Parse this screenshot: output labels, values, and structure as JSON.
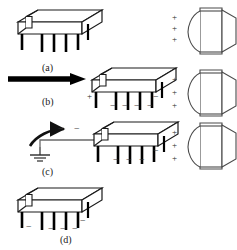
{
  "figure": {
    "background_color": "#ffffff",
    "ink_color": "#1a1a1a",
    "width": 237,
    "height": 250
  },
  "captions": [
    {
      "id": "a",
      "label": "(a)",
      "x": 42,
      "y": 62
    },
    {
      "id": "b",
      "label": "(b)",
      "x": 42,
      "y": 96
    },
    {
      "id": "c",
      "label": "(c)",
      "x": 42,
      "y": 166
    },
    {
      "id": "d",
      "label": "(d)",
      "x": 60,
      "y": 234
    }
  ],
  "steps": [
    {
      "id": "a",
      "label": "(a)",
      "description": "Uncharged IC package",
      "device_charges": [],
      "person_charges": [
        "+",
        "+",
        "+"
      ]
    },
    {
      "id": "b",
      "label": "(b)",
      "description": "Device approaches charged person; induction charges package",
      "device_charges": [
        "+",
        "-",
        "-",
        "-",
        "-",
        "-"
      ],
      "person_charges": [
        "+",
        "+",
        "+"
      ]
    },
    {
      "id": "c",
      "label": "(c)",
      "description": "Device grounded; electrons discharge to ground",
      "device_charges": [
        "-",
        "-",
        "-"
      ],
      "flow_charges": [
        "-",
        "-"
      ],
      "person_charges": [
        "+",
        "+",
        "+"
      ]
    },
    {
      "id": "d",
      "label": "(d)",
      "description": "Device left with residual negative charge",
      "device_charges": [
        "-",
        "-",
        "-",
        "-",
        "-"
      ],
      "person_charges": []
    }
  ],
  "charge_marks": [
    {
      "sign": "+",
      "x": 172,
      "y": 13
    },
    {
      "sign": "+",
      "x": 172,
      "y": 24
    },
    {
      "sign": "+",
      "x": 172,
      "y": 35
    },
    {
      "sign": "+",
      "x": 172,
      "y": 75
    },
    {
      "sign": "+",
      "x": 172,
      "y": 88
    },
    {
      "sign": "+",
      "x": 172,
      "y": 101
    },
    {
      "sign": "+",
      "x": 172,
      "y": 128
    },
    {
      "sign": "+",
      "x": 172,
      "y": 141
    },
    {
      "sign": "+",
      "x": 172,
      "y": 154
    },
    {
      "sign": "+",
      "x": 87,
      "y": 92
    },
    {
      "sign": "−",
      "x": 110,
      "y": 101
    },
    {
      "sign": "−",
      "x": 122,
      "y": 101
    },
    {
      "sign": "−",
      "x": 134,
      "y": 101
    },
    {
      "sign": "−",
      "x": 147,
      "y": 101
    },
    {
      "sign": "−",
      "x": 153,
      "y": 92
    },
    {
      "sign": "−",
      "x": 58,
      "y": 124
    },
    {
      "sign": "−",
      "x": 74,
      "y": 124
    },
    {
      "sign": "−",
      "x": 113,
      "y": 155
    },
    {
      "sign": "−",
      "x": 126,
      "y": 155
    },
    {
      "sign": "−",
      "x": 139,
      "y": 155
    },
    {
      "sign": "−",
      "x": 153,
      "y": 146
    },
    {
      "sign": "−",
      "x": 26,
      "y": 222
    },
    {
      "sign": "−",
      "x": 48,
      "y": 224
    },
    {
      "sign": "−",
      "x": 60,
      "y": 224
    },
    {
      "sign": "−",
      "x": 72,
      "y": 224
    },
    {
      "sign": "−",
      "x": 80,
      "y": 216
    }
  ],
  "icons": {
    "device": "ic-package-icon",
    "person": "charged-person-icon",
    "ground": "earth-ground-icon",
    "arrow_straight": "thick-right-arrow-icon",
    "arrow_curved": "curved-discharge-arrow-icon"
  }
}
